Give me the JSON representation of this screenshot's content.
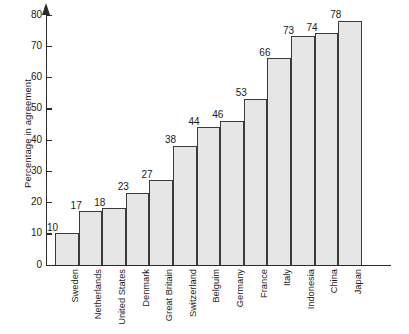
{
  "chart_data": {
    "type": "bar",
    "title": "",
    "subtitle": "",
    "xlabel": "",
    "ylabel": "Percentage in agreement",
    "ylim": [
      0,
      80
    ],
    "ytick_values": [
      0,
      10,
      20,
      30,
      40,
      50,
      60,
      70,
      80
    ],
    "ytick_labels": [
      "0",
      "10",
      "20",
      "30",
      "40",
      "50",
      "60",
      "70",
      "80"
    ],
    "grid": false,
    "legend": false,
    "legend_position": "none",
    "axis_arrow": true,
    "bar_fill_color": "#e6e6e6",
    "bar_edge_color": "#3a3a3a",
    "background_color": "#ffffff",
    "categories": [
      "Sweden",
      "Netherlands",
      "United States",
      "Denmark",
      "Great Britain",
      "Switzerland",
      "Belguim",
      "Germany",
      "France",
      "Italy",
      "Indonesia",
      "China",
      "Japan"
    ],
    "values": [
      10,
      17,
      18,
      23,
      27,
      38,
      44,
      46,
      53,
      66,
      73,
      74,
      78
    ],
    "value_labels": [
      "10",
      "17",
      "18",
      "23",
      "27",
      "38",
      "44",
      "46",
      "53",
      "66",
      "73",
      "74",
      "78"
    ]
  }
}
